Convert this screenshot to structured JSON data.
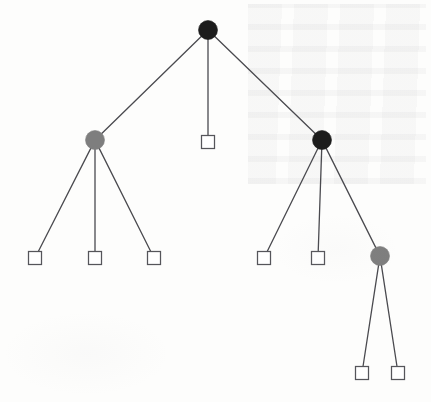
{
  "figure": {
    "type": "tree-diagram",
    "width": 431,
    "height": 402,
    "background_color": "#fdfdfc"
  },
  "style": {
    "internal_node_black": "#1c1c1c",
    "internal_node_gray": "#7e7e7e",
    "leaf_fill": "#ffffff",
    "leaf_stroke": "#55555a",
    "edge_color": "#4a4a4f",
    "edge_width": 1.3,
    "circle_radius": 9.5,
    "square_size": 13
  },
  "chart_data": {
    "type": "tree",
    "title": "",
    "node_shapes": [
      "circle",
      "square"
    ],
    "node_colors": [
      "black",
      "gray",
      "white"
    ],
    "nodes": [
      {
        "id": "n0",
        "label": "root",
        "shape": "circle",
        "color": "black",
        "fill": "#1c1c1c",
        "x": 208,
        "y": 30,
        "depth": 0,
        "children": [
          "n1",
          "n2",
          "n3"
        ]
      },
      {
        "id": "n1",
        "label": "left-internal",
        "shape": "circle",
        "color": "gray",
        "fill": "#7e7e7e",
        "x": 95,
        "y": 140,
        "depth": 1,
        "children": [
          "n4",
          "n5",
          "n6"
        ]
      },
      {
        "id": "n2",
        "label": "center-leaf",
        "shape": "square",
        "color": "white",
        "fill": "#ffffff",
        "x": 208,
        "y": 142,
        "depth": 1,
        "children": []
      },
      {
        "id": "n3",
        "label": "right-internal",
        "shape": "circle",
        "color": "black",
        "fill": "#1c1c1c",
        "x": 322,
        "y": 140,
        "depth": 1,
        "children": [
          "n7",
          "n8",
          "n9"
        ]
      },
      {
        "id": "n4",
        "label": "leaf-1",
        "shape": "square",
        "color": "white",
        "fill": "#ffffff",
        "x": 35,
        "y": 258,
        "depth": 2,
        "children": []
      },
      {
        "id": "n5",
        "label": "leaf-2",
        "shape": "square",
        "color": "white",
        "fill": "#ffffff",
        "x": 95,
        "y": 258,
        "depth": 2,
        "children": []
      },
      {
        "id": "n6",
        "label": "leaf-3",
        "shape": "square",
        "color": "white",
        "fill": "#ffffff",
        "x": 154,
        "y": 258,
        "depth": 2,
        "children": []
      },
      {
        "id": "n7",
        "label": "leaf-4",
        "shape": "square",
        "color": "white",
        "fill": "#ffffff",
        "x": 264,
        "y": 258,
        "depth": 2,
        "children": []
      },
      {
        "id": "n8",
        "label": "leaf-5",
        "shape": "square",
        "color": "white",
        "fill": "#ffffff",
        "x": 318,
        "y": 258,
        "depth": 2,
        "children": []
      },
      {
        "id": "n9",
        "label": "lower-right-internal",
        "shape": "circle",
        "color": "gray",
        "fill": "#7e7e7e",
        "x": 380,
        "y": 256,
        "depth": 2,
        "children": [
          "n10",
          "n11"
        ]
      },
      {
        "id": "n10",
        "label": "leaf-6",
        "shape": "square",
        "color": "white",
        "fill": "#ffffff",
        "x": 362,
        "y": 373,
        "depth": 3,
        "children": []
      },
      {
        "id": "n11",
        "label": "leaf-7",
        "shape": "square",
        "color": "white",
        "fill": "#ffffff",
        "x": 398,
        "y": 373,
        "depth": 3,
        "children": []
      }
    ],
    "edges": [
      {
        "from": "n0",
        "to": "n1"
      },
      {
        "from": "n0",
        "to": "n2"
      },
      {
        "from": "n0",
        "to": "n3"
      },
      {
        "from": "n1",
        "to": "n4"
      },
      {
        "from": "n1",
        "to": "n5"
      },
      {
        "from": "n1",
        "to": "n6"
      },
      {
        "from": "n3",
        "to": "n7"
      },
      {
        "from": "n3",
        "to": "n8"
      },
      {
        "from": "n3",
        "to": "n9"
      },
      {
        "from": "n9",
        "to": "n10"
      },
      {
        "from": "n9",
        "to": "n11"
      }
    ]
  }
}
